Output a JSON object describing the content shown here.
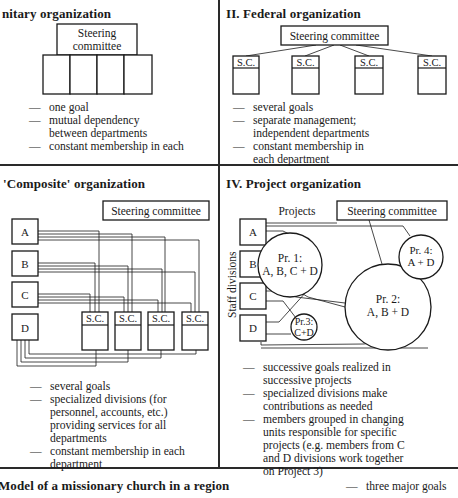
{
  "panels": {
    "unitary": {
      "title": "nitary organization",
      "steering_line1": "Steering",
      "steering_line2": "committee",
      "bullets": [
        {
          "text": "one goal"
        },
        {
          "text": "mutual dependency between departments"
        },
        {
          "text": "constant membership in each"
        }
      ]
    },
    "federal": {
      "title": "II. Federal organization",
      "steering": "Steering committee",
      "sc_label": "S.C.",
      "bullets": [
        {
          "text": "several goals"
        },
        {
          "text": "separate management; independent departments"
        },
        {
          "text": "constant membership in each department"
        }
      ]
    },
    "composite": {
      "title": "'Composite' organization",
      "steering": "Steering committee",
      "divisions": [
        "A",
        "B",
        "C",
        "D"
      ],
      "sc_label": "S.C.",
      "bullets": [
        {
          "text": "several goals"
        },
        {
          "text": "specialized divisions (for personnel, accounts, etc.) providing services for all departments"
        },
        {
          "text": "constant membership in each department"
        }
      ]
    },
    "project": {
      "title": "IV. Project organization",
      "projects_label": "Projects",
      "steering": "Steering committee",
      "staff_label": "Staff divisions",
      "divisions": [
        "A",
        "B",
        "C",
        "D"
      ],
      "projects": [
        {
          "line1": "Pr. 1:",
          "line2": "A, B, C + D"
        },
        {
          "line1": "Pr. 2:",
          "line2": "A, B + D"
        },
        {
          "line1": "Pr.3:",
          "line2": "C+D"
        },
        {
          "line1": "Pr. 4:",
          "line2": "A + D"
        }
      ],
      "bullets": [
        {
          "text": "successive goals realized in successive projects"
        },
        {
          "text": "specialized divisions make contributions as needed"
        },
        {
          "text": "members grouped in changing units responsible for specific projects (e.g. members from C and D divisions work together on Project 3)"
        }
      ]
    }
  },
  "footer": {
    "title": "Model of a missionary church in a region",
    "bullet": "three major goals"
  }
}
